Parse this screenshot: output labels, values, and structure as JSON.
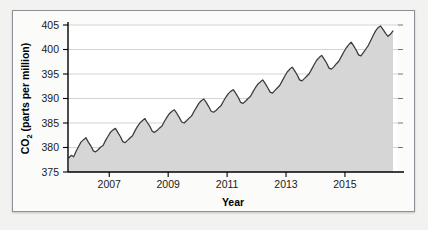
{
  "figure": {
    "background_color": "#f2f2f0",
    "panel_color": "#fbfbfa",
    "border_color": "#8e9096"
  },
  "chart_data": {
    "type": "area",
    "title": "",
    "xlabel": "Year",
    "ylabel": "CO2 (parts per million)",
    "ylabel_prefix": "CO",
    "ylabel_subscript": "2",
    "ylabel_suffix": " (parts per million)",
    "xlim": [
      2005.6,
      2016.8
    ],
    "ylim": [
      375,
      405
    ],
    "yticks": [
      375,
      380,
      385,
      390,
      395,
      400,
      405
    ],
    "ytick_labels": [
      "375",
      "380",
      "385",
      "390",
      "395",
      "400",
      "405"
    ],
    "xticks": [
      2007,
      2009,
      2011,
      2013,
      2015
    ],
    "xtick_labels": [
      "2007",
      "2009",
      "2011",
      "2013",
      "2015"
    ],
    "grid": true,
    "grid_axis": "y",
    "legend": "none",
    "line_color": "#3a3a3a",
    "fill_color": "#d6d6d6",
    "series_name": "Atmospheric CO2 concentration",
    "x": [
      2005.63,
      2005.71,
      2005.79,
      2005.88,
      2005.96,
      2006.04,
      2006.13,
      2006.21,
      2006.29,
      2006.38,
      2006.46,
      2006.54,
      2006.63,
      2006.71,
      2006.79,
      2006.88,
      2006.96,
      2007.04,
      2007.13,
      2007.21,
      2007.29,
      2007.38,
      2007.46,
      2007.54,
      2007.63,
      2007.71,
      2007.79,
      2007.88,
      2007.96,
      2008.04,
      2008.13,
      2008.21,
      2008.29,
      2008.38,
      2008.46,
      2008.54,
      2008.63,
      2008.71,
      2008.79,
      2008.88,
      2008.96,
      2009.04,
      2009.13,
      2009.21,
      2009.29,
      2009.38,
      2009.46,
      2009.54,
      2009.63,
      2009.71,
      2009.79,
      2009.88,
      2009.96,
      2010.04,
      2010.13,
      2010.21,
      2010.29,
      2010.38,
      2010.46,
      2010.54,
      2010.63,
      2010.71,
      2010.79,
      2010.88,
      2010.96,
      2011.04,
      2011.13,
      2011.21,
      2011.29,
      2011.38,
      2011.46,
      2011.54,
      2011.63,
      2011.71,
      2011.79,
      2011.88,
      2011.96,
      2012.04,
      2012.13,
      2012.21,
      2012.29,
      2012.38,
      2012.46,
      2012.54,
      2012.63,
      2012.71,
      2012.79,
      2012.88,
      2012.96,
      2013.04,
      2013.13,
      2013.21,
      2013.29,
      2013.38,
      2013.46,
      2013.54,
      2013.63,
      2013.71,
      2013.79,
      2013.88,
      2013.96,
      2014.04,
      2014.13,
      2014.21,
      2014.29,
      2014.38,
      2014.46,
      2014.54,
      2014.63,
      2014.71,
      2014.79,
      2014.88,
      2014.96,
      2015.04,
      2015.13,
      2015.21,
      2015.29,
      2015.38,
      2015.46,
      2015.54,
      2015.63,
      2015.71,
      2015.79,
      2015.88,
      2015.96,
      2016.04,
      2016.13,
      2016.21,
      2016.29,
      2016.38,
      2016.46,
      2016.54,
      2016.63
    ],
    "values": [
      377.9,
      378.4,
      378.1,
      379.3,
      380.2,
      381.1,
      381.6,
      382.0,
      381.1,
      380.3,
      379.3,
      379.1,
      379.6,
      380.1,
      380.4,
      381.5,
      382.3,
      383.1,
      383.6,
      383.9,
      383.1,
      382.2,
      381.2,
      381.0,
      381.5,
      382.0,
      382.4,
      383.5,
      384.3,
      385.0,
      385.5,
      385.9,
      385.1,
      384.3,
      383.3,
      383.1,
      383.5,
      384.0,
      384.4,
      385.4,
      386.2,
      386.9,
      387.4,
      387.7,
      387.0,
      386.1,
      385.2,
      385.0,
      385.5,
      386.0,
      386.4,
      387.4,
      388.2,
      389.0,
      389.6,
      389.9,
      389.2,
      388.3,
      387.4,
      387.2,
      387.6,
      388.1,
      388.5,
      389.5,
      390.3,
      391.0,
      391.5,
      391.8,
      391.1,
      390.2,
      389.2,
      389.0,
      389.5,
      390.0,
      390.4,
      391.4,
      392.2,
      392.9,
      393.4,
      393.8,
      393.1,
      392.2,
      391.3,
      391.1,
      391.7,
      392.2,
      392.7,
      393.7,
      394.6,
      395.4,
      396.0,
      396.4,
      395.7,
      394.8,
      393.8,
      393.6,
      394.1,
      394.6,
      395.1,
      396.1,
      397.0,
      397.8,
      398.4,
      398.8,
      398.1,
      397.2,
      396.2,
      396.0,
      396.5,
      397.1,
      397.6,
      398.6,
      399.5,
      400.3,
      401.0,
      401.5,
      400.8,
      399.9,
      398.9,
      398.7,
      399.4,
      400.1,
      400.8,
      401.9,
      402.9,
      403.8,
      404.5,
      404.8,
      404.1,
      403.3,
      402.7,
      403.1,
      403.8
    ]
  }
}
